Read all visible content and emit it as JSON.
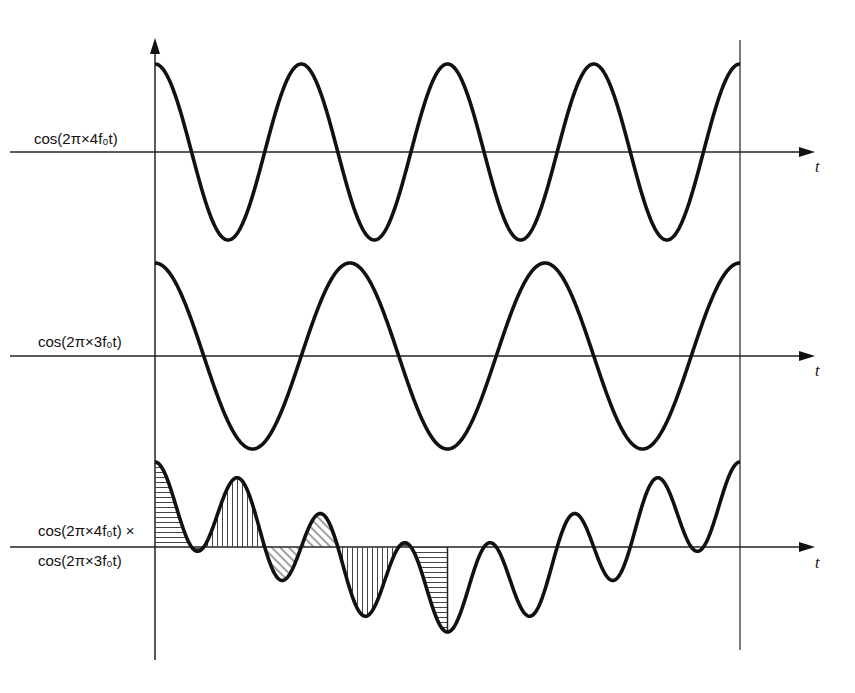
{
  "diagram": {
    "title": "",
    "geometry": {
      "x_start": 155,
      "x_end": 740,
      "vertical_axis_top": 40,
      "vertical_axis_bottom": 660,
      "arrow_x_end": 815
    },
    "plots": [
      {
        "id": "cos4",
        "label": "cos(2π×4f₀t)",
        "axis_label": "t",
        "baseline_y": 152,
        "amplitude": 88,
        "harmonics": [
          4
        ]
      },
      {
        "id": "cos3",
        "label": "cos(2π×3f₀t)",
        "axis_label": "t",
        "baseline_y": 356,
        "amplitude": 93,
        "harmonics": [
          3
        ]
      },
      {
        "id": "product",
        "label_line1": "cos(2π×4f₀t) ×",
        "label_line2": "cos(2π×3f₀t)",
        "axis_label": "t",
        "baseline_y": 547,
        "amplitude": 85,
        "harmonics": [
          4,
          3
        ],
        "shaded_fraction": 0.5
      }
    ],
    "colors": {
      "curve": "#111111",
      "axis": "#222222",
      "hatch": "#444444",
      "background": "#ffffff"
    }
  }
}
